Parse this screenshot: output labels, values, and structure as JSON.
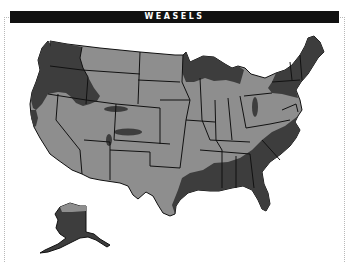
{
  "title": "WEASELS",
  "map": {
    "region": "United States",
    "legend_implied": {
      "range_color": "#3d3d3d",
      "non_range_color": "#8e8e8e",
      "outline_color": "#111111",
      "water_color": "#ffffff"
    },
    "range_areas": [
      "Pacific Northwest",
      "Northern Rockies",
      "Northern California coast",
      "Upper Great Lakes",
      "New England and Mid-Atlantic",
      "Southeast and Gulf Coast",
      "East Texas",
      "Alaska",
      "Scattered patches in Colorado and Nebraska"
    ],
    "insets": [
      "Alaska"
    ]
  },
  "colors": {
    "title_bg": "#111111",
    "title_text": "#ffffff",
    "frame": "#b8b8b8"
  }
}
